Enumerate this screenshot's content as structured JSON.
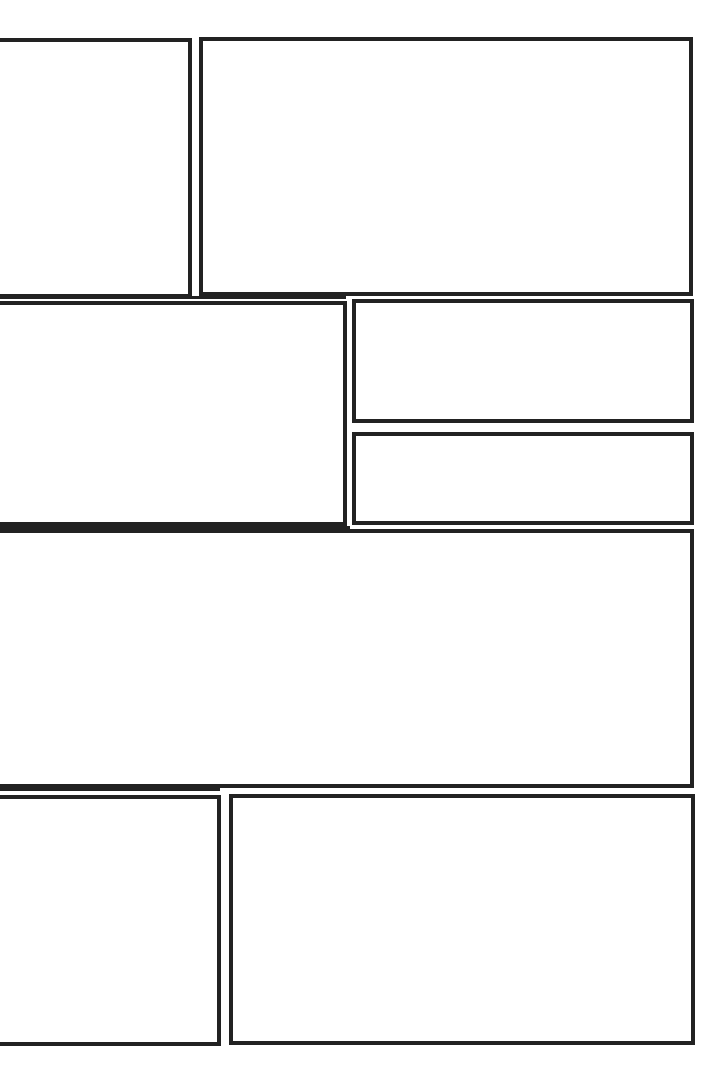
{
  "page": {
    "type": "comic-panel-layout-blank",
    "background": "#ffffff",
    "border_color": "#222222"
  },
  "panels": [
    {
      "id": 1,
      "row": 1,
      "label": ""
    },
    {
      "id": 2,
      "row": 1,
      "label": ""
    },
    {
      "id": 3,
      "row": 2,
      "label": ""
    },
    {
      "id": 4,
      "row": 2,
      "label": ""
    },
    {
      "id": 5,
      "row": 2,
      "label": ""
    },
    {
      "id": 6,
      "row": 3,
      "label": ""
    },
    {
      "id": 7,
      "row": 4,
      "label": ""
    },
    {
      "id": 8,
      "row": 4,
      "label": ""
    }
  ]
}
